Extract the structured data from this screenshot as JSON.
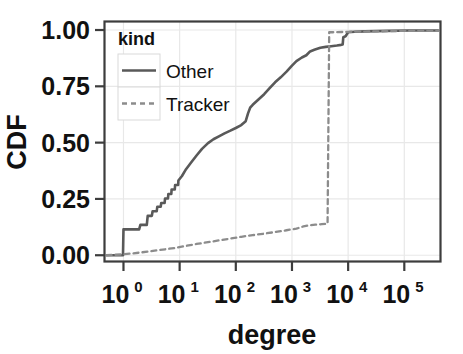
{
  "chart_data": {
    "type": "line",
    "title": "",
    "xlabel": "degree",
    "ylabel": "CDF",
    "xscale": "log",
    "yscale": "linear",
    "xlim": [
      0.45,
      450000
    ],
    "ylim": [
      -0.03,
      1.04
    ],
    "grid": true,
    "legend": {
      "title": "kind",
      "position": "top-left",
      "entries": [
        {
          "name": "Other",
          "style": "solid",
          "color": "#595959"
        },
        {
          "name": "Tracker",
          "style": "dashed",
          "color": "#8c8c8c"
        }
      ]
    },
    "xticks": [
      {
        "value": 1,
        "label": "10",
        "exponent": "0"
      },
      {
        "value": 10,
        "label": "10",
        "exponent": "1"
      },
      {
        "value": 100,
        "label": "10",
        "exponent": "2"
      },
      {
        "value": 1000,
        "label": "10",
        "exponent": "3"
      },
      {
        "value": 10000,
        "label": "10",
        "exponent": "4"
      },
      {
        "value": 100000,
        "label": "10",
        "exponent": "5"
      }
    ],
    "yticks": [
      {
        "value": 0.0,
        "label": "0.00"
      },
      {
        "value": 0.25,
        "label": "0.25"
      },
      {
        "value": 0.5,
        "label": "0.50"
      },
      {
        "value": 0.75,
        "label": "0.75"
      },
      {
        "value": 1.0,
        "label": "1.00"
      }
    ],
    "series": [
      {
        "name": "Other",
        "style": "solid",
        "color": "#595959",
        "points": [
          [
            0.5,
            0.0
          ],
          [
            0.98,
            0.0
          ],
          [
            1.0,
            0.115
          ],
          [
            1.9,
            0.115
          ],
          [
            2.0,
            0.135
          ],
          [
            2.6,
            0.135
          ],
          [
            2.7,
            0.175
          ],
          [
            3.2,
            0.175
          ],
          [
            3.3,
            0.195
          ],
          [
            3.9,
            0.195
          ],
          [
            4.0,
            0.215
          ],
          [
            4.6,
            0.215
          ],
          [
            4.7,
            0.232
          ],
          [
            5.4,
            0.232
          ],
          [
            5.5,
            0.252
          ],
          [
            6.2,
            0.252
          ],
          [
            6.3,
            0.272
          ],
          [
            7.1,
            0.272
          ],
          [
            7.2,
            0.292
          ],
          [
            8.2,
            0.292
          ],
          [
            8.3,
            0.312
          ],
          [
            9.4,
            0.312
          ],
          [
            9.5,
            0.332
          ],
          [
            11,
            0.352
          ],
          [
            13,
            0.382
          ],
          [
            16,
            0.412
          ],
          [
            20,
            0.443
          ],
          [
            25,
            0.472
          ],
          [
            32,
            0.498
          ],
          [
            40,
            0.515
          ],
          [
            50,
            0.528
          ],
          [
            63,
            0.541
          ],
          [
            80,
            0.553
          ],
          [
            100,
            0.565
          ],
          [
            125,
            0.578
          ],
          [
            150,
            0.595
          ],
          [
            165,
            0.63
          ],
          [
            180,
            0.655
          ],
          [
            200,
            0.668
          ],
          [
            250,
            0.69
          ],
          [
            320,
            0.715
          ],
          [
            400,
            0.742
          ],
          [
            500,
            0.768
          ],
          [
            630,
            0.79
          ],
          [
            800,
            0.815
          ],
          [
            1000,
            0.842
          ],
          [
            1200,
            0.862
          ],
          [
            1500,
            0.878
          ],
          [
            1800,
            0.888
          ],
          [
            2100,
            0.905
          ],
          [
            2500,
            0.912
          ],
          [
            3200,
            0.921
          ],
          [
            4000,
            0.925
          ],
          [
            5000,
            0.928
          ],
          [
            6300,
            0.931
          ],
          [
            7500,
            0.934
          ],
          [
            8000,
            0.936
          ],
          [
            8200,
            0.968
          ],
          [
            9000,
            0.972
          ],
          [
            10000,
            0.99
          ],
          [
            13000,
            0.992
          ],
          [
            20000,
            0.994
          ],
          [
            50000,
            0.996
          ],
          [
            120000,
            0.998
          ],
          [
            400000,
            0.998
          ]
        ]
      },
      {
        "name": "Tracker",
        "style": "dashed",
        "color": "#8c8c8c",
        "points": [
          [
            0.5,
            0.0
          ],
          [
            1.0,
            0.004
          ],
          [
            2.0,
            0.012
          ],
          [
            3.0,
            0.018
          ],
          [
            5.0,
            0.025
          ],
          [
            8.0,
            0.032
          ],
          [
            12,
            0.04
          ],
          [
            20,
            0.05
          ],
          [
            32,
            0.058
          ],
          [
            50,
            0.066
          ],
          [
            80,
            0.074
          ],
          [
            125,
            0.082
          ],
          [
            200,
            0.089
          ],
          [
            320,
            0.096
          ],
          [
            500,
            0.103
          ],
          [
            800,
            0.111
          ],
          [
            1200,
            0.118
          ],
          [
            1600,
            0.128
          ],
          [
            2000,
            0.133
          ],
          [
            2600,
            0.136
          ],
          [
            3400,
            0.138
          ],
          [
            4300,
            0.14
          ],
          [
            4600,
            0.99
          ],
          [
            6000,
            0.99
          ],
          [
            10000,
            0.992
          ],
          [
            30000,
            0.994
          ],
          [
            100000,
            0.996
          ],
          [
            400000,
            0.996
          ]
        ]
      }
    ]
  },
  "axes": {
    "plot_area": {
      "left": 104,
      "top": 21,
      "right": 441,
      "bottom": 262
    }
  }
}
